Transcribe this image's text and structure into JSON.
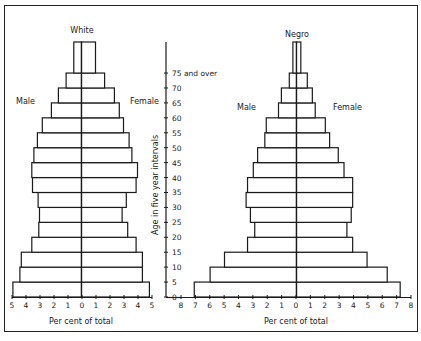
{
  "chart_data": [
    {
      "type": "bar",
      "subtype": "population-pyramid",
      "title": "White",
      "xlabel": "Per cent of total",
      "ylabel": "Age in five year intervals",
      "left_label": "Male",
      "right_label": "Female",
      "xlim": [
        -5,
        5
      ],
      "x_ticks": [
        "5",
        "4",
        "3",
        "2",
        "1",
        "0",
        "1",
        "2",
        "3",
        "4",
        "5"
      ],
      "categories": [
        "0-4",
        "5-9",
        "10-14",
        "15-19",
        "20-24",
        "25-29",
        "30-34",
        "35-39",
        "40-44",
        "45-49",
        "50-54",
        "55-59",
        "60-64",
        "65-69",
        "70-74",
        "75 and over"
      ],
      "series": [
        {
          "name": "Male",
          "values": [
            4.9,
            4.4,
            4.3,
            3.55,
            3.05,
            3.0,
            3.1,
            3.5,
            3.55,
            3.4,
            3.15,
            2.8,
            2.15,
            1.65,
            1.1,
            0.55
          ]
        },
        {
          "name": "Female",
          "values": [
            4.85,
            4.35,
            4.35,
            3.9,
            3.3,
            2.9,
            3.2,
            3.9,
            4.0,
            3.6,
            3.4,
            3.0,
            2.7,
            2.35,
            1.65,
            1.0
          ]
        }
      ]
    },
    {
      "type": "bar",
      "subtype": "population-pyramid",
      "title": "Negro",
      "xlabel": "Per cent of total",
      "ylabel": "Age in five year intervals",
      "left_label": "Male",
      "right_label": "Female",
      "xlim": [
        -8,
        8
      ],
      "x_ticks": [
        "8",
        "7",
        "6",
        "5",
        "4",
        "3",
        "2",
        "1",
        "0",
        "1",
        "2",
        "3",
        "4",
        "5",
        "6",
        "7",
        "8"
      ],
      "categories": [
        "0-4",
        "5-9",
        "10-14",
        "15-19",
        "20-24",
        "25-29",
        "30-34",
        "35-39",
        "40-44",
        "45-49",
        "50-54",
        "55-59",
        "60-64",
        "65-69",
        "70-74",
        "75 and over"
      ],
      "series": [
        {
          "name": "Male",
          "values": [
            7.1,
            6.0,
            5.0,
            3.4,
            2.9,
            3.2,
            3.5,
            3.4,
            3.0,
            2.7,
            2.2,
            2.1,
            1.25,
            1.05,
            0.5,
            0.25
          ]
        },
        {
          "name": "Female",
          "values": [
            7.2,
            6.3,
            4.9,
            3.9,
            3.5,
            3.8,
            3.9,
            3.9,
            3.3,
            2.9,
            2.3,
            2.0,
            1.3,
            1.1,
            0.75,
            0.3
          ]
        }
      ]
    }
  ],
  "age_axis": {
    "title": "Age in five year intervals",
    "ticks": [
      "0",
      "5",
      "10",
      "15",
      "20",
      "25",
      "30",
      "35",
      "40",
      "45",
      "50",
      "55",
      "60",
      "65",
      "70",
      "75 and over"
    ]
  },
  "labels": {
    "white_title": "White",
    "negro_title": "Negro",
    "male": "Male",
    "female": "Female",
    "xlabel": "Per cent of total"
  }
}
